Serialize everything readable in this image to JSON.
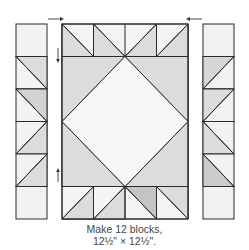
{
  "figure": {
    "caption_line1": "Make 12 blocks,",
    "caption_line2": "12½\" × 12½\".",
    "colors": {
      "stroke": "#2b2b2b",
      "fabric_light": "#f2f2f2",
      "fabric_medium": "#dcdcdc",
      "fabric_dark": "#c4c4c4",
      "background": "#ffffff"
    },
    "components": [
      "left-strip",
      "center-unit",
      "right-strip"
    ],
    "pressing_arrows": [
      "top-left-right",
      "top-right-left",
      "center-left-down",
      "center-left-up"
    ]
  }
}
